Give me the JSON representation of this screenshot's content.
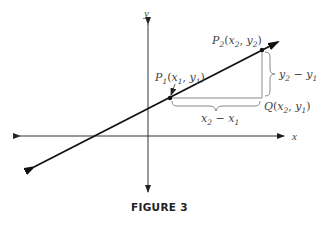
{
  "figure": {
    "caption": "FIGURE 3",
    "axes": {
      "x_label": "x",
      "y_label": "y"
    },
    "points": {
      "p1": {
        "name": "P",
        "sub": "1",
        "coords": "(x1, y1)",
        "x_sym": "x",
        "x_sub": "1",
        "y_sym": "y",
        "y_sub": "1"
      },
      "p2": {
        "name": "P",
        "sub": "2",
        "coords": "(x2, y2)",
        "x_sym": "x",
        "x_sub": "2",
        "y_sym": "y",
        "y_sub": "2"
      },
      "q": {
        "name": "Q",
        "coords": "(x2, y1)",
        "x_sym": "x",
        "x_sub": "2",
        "y_sym": "y",
        "y_sub": "1"
      }
    },
    "run_label": {
      "a": "x",
      "a_sub": "2",
      "op": " − ",
      "b": "x",
      "b_sub": "1"
    },
    "rise_label": {
      "a": "y",
      "a_sub": "2",
      "op": " − ",
      "b": "y",
      "b_sub": "1"
    },
    "colors": {
      "line": "#1a1a1a",
      "axis": "#333333",
      "guide": "#8a8a8a",
      "text": "#444444"
    }
  }
}
